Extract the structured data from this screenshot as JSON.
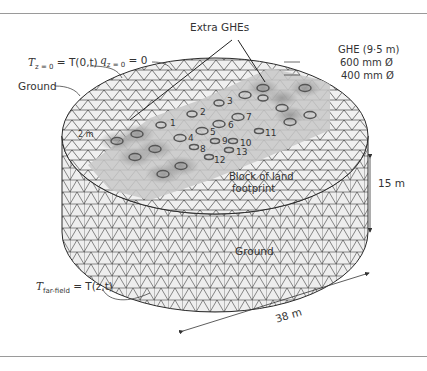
{
  "figure": {
    "labels": {
      "extra_ghes": "Extra GHEs",
      "top_boundary_T": "T",
      "top_boundary_T_sub": "z = 0",
      "top_boundary_T_rhs": "= T(0,t)",
      "top_boundary_q": "q",
      "top_boundary_q_sub": "z = 0",
      "top_boundary_q_rhs": "= 0",
      "ground_top": "Ground",
      "ground_side": "Ground",
      "ghe_title": "GHE (9·5 m)",
      "ghe_600": "600 mm Ø",
      "ghe_400": "400 mm Ø",
      "two_m": "2 m",
      "block_footprint_line1": "Block of land",
      "block_footprint_line2": "footprint",
      "height_dim": "15 m",
      "diameter_dim": "38 m",
      "far_field_T": "T",
      "far_field_sub": "far-field",
      "far_field_rhs": "= T(z,t)"
    },
    "ghe_numbers": [
      "1",
      "2",
      "3",
      "4",
      "5",
      "6",
      "7",
      "8",
      "9",
      "10",
      "11",
      "12",
      "13"
    ],
    "colors": {
      "mesh": "#2a2a2a",
      "fill": "#ececec",
      "footprint": "#bdbdbd",
      "ghe_ring": "#555555",
      "rule": "#9a9a9a"
    }
  }
}
